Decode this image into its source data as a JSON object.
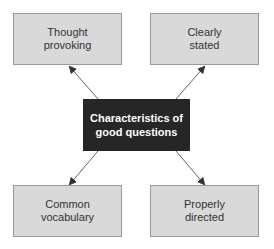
{
  "diagram": {
    "center": {
      "label": "Characteristics of good questions"
    },
    "nodes": [
      {
        "id": "top-left",
        "label": "Thought provoking"
      },
      {
        "id": "top-right",
        "label": "Clearly stated"
      },
      {
        "id": "bottom-left",
        "label": "Common vocabulary"
      },
      {
        "id": "bottom-right",
        "label": "Properly directed"
      }
    ],
    "colors": {
      "center_fill": "#262626",
      "leaf_fill": "#d9d9d9",
      "leaf_border": "#9a9a9a",
      "arrow": "#555555"
    }
  }
}
